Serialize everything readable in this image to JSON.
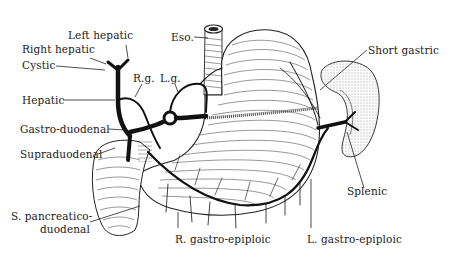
{
  "figure": {
    "background_color": "#ffffff",
    "ink_color": "#1a1a1a"
  },
  "labels": {
    "left_hepatic": "Left hepatic",
    "right_hepatic": "Right hepatic",
    "cystic": "Cystic",
    "hepatic": "Hepatic",
    "gastro_duodenal": "Gastro-duodenal",
    "supraduodenal": "Supraduodenal",
    "s_pancreatico_1": "S. pancreatico-",
    "s_pancreatico_2": "duodenal",
    "rg": "R.g.",
    "lg": "L.g.",
    "eso": "Eso.",
    "short_gastric": "Short gastric",
    "splenic": "Splenic",
    "r_gastro_epiploic": "R. gastro-epiploic",
    "l_gastro_epiploic": "L. gastro-epiploic"
  },
  "structures": [
    {
      "name": "stomach",
      "type": "organ"
    },
    {
      "name": "esophagus",
      "type": "organ"
    },
    {
      "name": "duodenum",
      "type": "organ"
    },
    {
      "name": "spleen",
      "type": "organ"
    }
  ]
}
